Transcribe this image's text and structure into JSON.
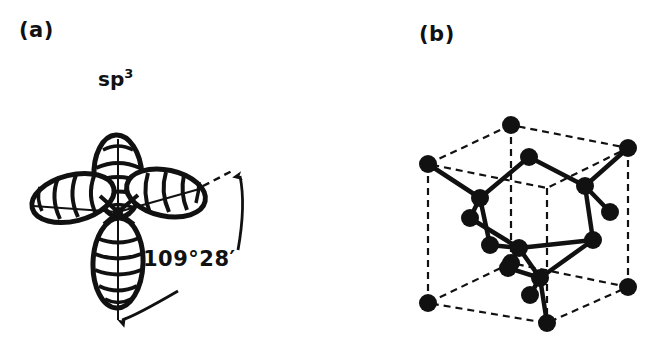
{
  "figure": {
    "background_color": "#ffffff",
    "ink_color": "#111111",
    "width": 666,
    "height": 357
  },
  "panels": [
    {
      "id": "a",
      "label": "(a)",
      "title": "sp",
      "title_superscript": "3",
      "subject": "sp3 hybrid orbital lobes",
      "angle_label": "109°28′",
      "angle_degrees": 109,
      "angle_minutes": 28,
      "lobe_count": 4
    },
    {
      "id": "b",
      "label": "(b)",
      "subject": "diamond cubic crystal lattice unit cell",
      "cube_edge_style": "dashed",
      "bond_style": "solid",
      "atom_color": "#111111"
    }
  ],
  "lattice": {
    "cube_corners": [
      {
        "name": "top-back",
        "x": 511,
        "y": 125
      },
      {
        "name": "top-left",
        "x": 428,
        "y": 164
      },
      {
        "name": "top-right",
        "x": 628,
        "y": 148
      },
      {
        "name": "top-front",
        "x": 547,
        "y": 188
      },
      {
        "name": "bottom-back",
        "x": 511,
        "y": 263
      },
      {
        "name": "bottom-left",
        "x": 428,
        "y": 303
      },
      {
        "name": "bottom-right",
        "x": 628,
        "y": 287
      },
      {
        "name": "bottom-front",
        "x": 547,
        "y": 323
      }
    ],
    "face_atoms": [
      {
        "name": "top-face-center",
        "x": 529,
        "y": 157
      },
      {
        "name": "upper-mid-right",
        "x": 585,
        "y": 186
      },
      {
        "name": "upper-mid-left",
        "x": 480,
        "y": 198
      },
      {
        "name": "right-face",
        "x": 610,
        "y": 212
      },
      {
        "name": "mid-left-low",
        "x": 470,
        "y": 218
      },
      {
        "name": "interior-center",
        "x": 519,
        "y": 248
      },
      {
        "name": "right-low",
        "x": 593,
        "y": 240
      },
      {
        "name": "left-low",
        "x": 490,
        "y": 245
      },
      {
        "name": "low-center",
        "x": 508,
        "y": 268
      },
      {
        "name": "front-low",
        "x": 540,
        "y": 278
      },
      {
        "name": "front-bottom",
        "x": 530,
        "y": 295
      }
    ]
  }
}
